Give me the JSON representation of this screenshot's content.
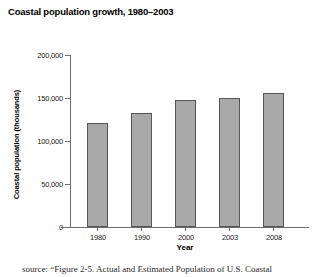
{
  "chart_data": {
    "type": "bar",
    "title": "Coastal population growth, 1980–2003",
    "xlabel": "Year",
    "ylabel": "Coastal population (thousands)",
    "categories": [
      "1980",
      "1990",
      "2000",
      "2003",
      "2008"
    ],
    "values": [
      121000,
      132500,
      147500,
      150000,
      156000
    ],
    "ylim": [
      0,
      200000
    ],
    "yticks": [
      0,
      50000,
      100000,
      150000,
      200000
    ],
    "ytick_labels": [
      "0",
      "50,000",
      "100,000",
      "150,000",
      "200,000"
    ],
    "grid": false,
    "legend": null,
    "bar_color": "#a9a9a9",
    "bar_border_color": "#555555",
    "axis_color": "#6e6e6e",
    "background": "#ffffff"
  },
  "source_note": {
    "text": "source: “Figure 2-5. Actual and Estimated Population of U.S. Coastal"
  }
}
